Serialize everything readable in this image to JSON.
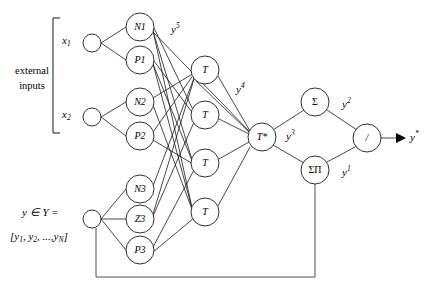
{
  "figure": {
    "background_color": "#ffffff",
    "line_color": "#1a1a1a",
    "width": 430,
    "height": 292
  },
  "labels": {
    "external_inputs_line1": "external",
    "external_inputs_line2": "inputs",
    "input_x1": "x",
    "input_x1_sub": "1",
    "input_x2": "x",
    "input_x2_sub": "2",
    "feedback_header": "y ∈ Y =",
    "feedback_vector_open": "[",
    "feedback_vector_y1": "y",
    "feedback_vector_y1_sub": "1",
    "feedback_vector_comma1": ", ",
    "feedback_vector_y2": "y",
    "feedback_vector_y2_sub": "2",
    "feedback_vector_comma2": ", ...,",
    "feedback_vector_yN": "y",
    "feedback_vector_yN_sub": "N",
    "feedback_vector_close": "]",
    "output": "y",
    "output_sup": "*"
  },
  "nodes": {
    "input_layer": [
      {
        "id": "in-x1",
        "label": "",
        "cx": 92,
        "cy": 43,
        "r": 9
      },
      {
        "id": "in-x2",
        "label": "",
        "cx": 92,
        "cy": 117,
        "r": 9
      },
      {
        "id": "in-y",
        "label": "",
        "cx": 92,
        "cy": 219,
        "r": 9
      }
    ],
    "membership_layer": [
      {
        "id": "N1",
        "label": "N1",
        "cx": 140,
        "cy": 27,
        "r": 14
      },
      {
        "id": "P1",
        "label": "P1",
        "cx": 140,
        "cy": 60,
        "r": 14
      },
      {
        "id": "N2",
        "label": "N2",
        "cx": 140,
        "cy": 102,
        "r": 14
      },
      {
        "id": "P2",
        "label": "P2",
        "cx": 140,
        "cy": 136,
        "r": 14
      },
      {
        "id": "N3",
        "label": "N3",
        "cx": 140,
        "cy": 189,
        "r": 14
      },
      {
        "id": "Z3",
        "label": "Z3",
        "cx": 140,
        "cy": 219,
        "r": 14
      },
      {
        "id": "P3",
        "label": "P3",
        "cx": 140,
        "cy": 250,
        "r": 14
      }
    ],
    "tnorm_layer": [
      {
        "id": "T-1",
        "label": "T",
        "cx": 205,
        "cy": 70,
        "r": 14
      },
      {
        "id": "T-2",
        "label": "T",
        "cx": 205,
        "cy": 115,
        "r": 14
      },
      {
        "id": "T-3",
        "label": "T",
        "cx": 205,
        "cy": 163,
        "r": 14
      },
      {
        "id": "T-4",
        "label": "T",
        "cx": 205,
        "cy": 212,
        "r": 14
      }
    ],
    "aggregation_layer": [
      {
        "id": "T-star",
        "label": "T*",
        "cx": 262,
        "cy": 137,
        "r": 14
      }
    ],
    "summation_layer": [
      {
        "id": "Sigma",
        "label": "Σ",
        "cx": 315,
        "cy": 102,
        "r": 14,
        "upright": true
      },
      {
        "id": "SigmaPi",
        "label": "ΣΠ",
        "cx": 315,
        "cy": 170,
        "r": 14,
        "upright": true
      }
    ],
    "output_layer": [
      {
        "id": "divide",
        "label": "/",
        "cx": 367,
        "cy": 138,
        "r": 14
      }
    ]
  },
  "signal_labels": [
    {
      "id": "y5",
      "base": "y",
      "sup": "5",
      "x": 176,
      "y": 29
    },
    {
      "id": "y4",
      "base": "y",
      "sup": "4",
      "x": 241,
      "y": 89
    },
    {
      "id": "y3",
      "base": "y",
      "sup": "3",
      "x": 291,
      "y": 136
    },
    {
      "id": "y2",
      "base": "y",
      "sup": "2",
      "x": 347,
      "y": 104
    },
    {
      "id": "y1",
      "base": "y",
      "sup": "1",
      "x": 347,
      "y": 172
    }
  ]
}
